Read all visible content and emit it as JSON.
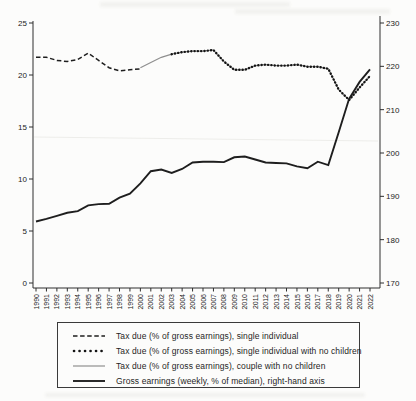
{
  "chart_data": {
    "type": "line",
    "title": "",
    "xlabel": "",
    "ylabel_left": "",
    "ylabel_right": "",
    "grid": false,
    "legend_position": "bottom",
    "x_ticks": [
      "1990",
      "1991",
      "1992",
      "1993",
      "1994",
      "1995",
      "1996",
      "1997",
      "1998",
      "1999",
      "2000",
      "2001",
      "2002",
      "2003",
      "2004",
      "2005",
      "2006",
      "2007",
      "2008",
      "2009",
      "2010",
      "2011",
      "2012",
      "2013",
      "2014",
      "2015",
      "2016",
      "2017",
      "2018",
      "2019",
      "2020",
      "2021",
      "2022"
    ],
    "left_axis": {
      "ticks": [
        0,
        5,
        10,
        15,
        20,
        25
      ],
      "range": [
        0,
        25
      ]
    },
    "right_axis": {
      "ticks": [
        170,
        180,
        190,
        200,
        210,
        220,
        230
      ],
      "range": [
        170,
        230
      ]
    },
    "series": [
      {
        "name": "Tax due (% of gross earnings), single individual",
        "axis": "left",
        "style": "dashed",
        "years": [
          1990,
          1991,
          1992,
          1993,
          1994,
          1995,
          1996,
          1997,
          1998,
          1999,
          2000
        ],
        "values": [
          21.7,
          21.7,
          21.4,
          21.3,
          21.5,
          22.1,
          21.4,
          20.7,
          20.4,
          20.5,
          20.6
        ]
      },
      {
        "name": "Tax due (% of gross earnings), couple with no children",
        "axis": "left",
        "style": "solid-thin",
        "years": [
          2000,
          2001,
          2002,
          2003,
          2004,
          2005,
          2006,
          2007,
          2008,
          2009,
          2010,
          2011,
          2012,
          2013,
          2014,
          2015,
          2016,
          2017,
          2018,
          2019,
          2020,
          2021,
          2022
        ],
        "values": [
          20.7,
          21.2,
          21.7,
          22.0,
          22.2,
          22.3,
          22.3,
          22.4,
          21.3,
          20.5,
          20.5,
          20.9,
          21.0,
          20.9,
          20.9,
          21.0,
          20.8,
          20.8,
          20.6,
          18.6,
          17.6,
          18.8,
          19.9
        ]
      },
      {
        "name": "Tax due (% of gross earnings), single individual with no children",
        "axis": "left",
        "style": "dotted",
        "years": [
          2003,
          2004,
          2005,
          2006,
          2007,
          2008,
          2009,
          2010,
          2011,
          2012,
          2013,
          2014,
          2015,
          2016,
          2017,
          2018,
          2019,
          2020,
          2021,
          2022
        ],
        "values": [
          22.0,
          22.2,
          22.3,
          22.3,
          22.4,
          21.3,
          20.5,
          20.5,
          20.9,
          21.0,
          20.9,
          20.9,
          21.0,
          20.8,
          20.8,
          20.6,
          18.6,
          17.6,
          18.8,
          19.9
        ]
      },
      {
        "name": "Gross earnings (weekly, % of median), right-hand axis",
        "axis": "right",
        "style": "solid-thick",
        "years": [
          1990,
          1991,
          1992,
          1993,
          1994,
          1995,
          1996,
          1997,
          1998,
          1999,
          2000,
          2001,
          2002,
          2003,
          2004,
          2005,
          2006,
          2007,
          2008,
          2009,
          2010,
          2011,
          2012,
          2013,
          2014,
          2015,
          2016,
          2017,
          2018,
          2019,
          2020,
          2021,
          2022
        ],
        "values": [
          184.2,
          184.8,
          185.5,
          186.2,
          186.6,
          187.9,
          188.2,
          188.3,
          189.7,
          190.6,
          193.0,
          195.8,
          196.2,
          195.4,
          196.3,
          197.8,
          198.0,
          198.0,
          197.9,
          199.0,
          199.2,
          198.5,
          197.8,
          197.7,
          197.6,
          196.9,
          196.5,
          198.0,
          197.2,
          204.8,
          212.5,
          216.4,
          219.3
        ]
      }
    ]
  },
  "legend": {
    "items": [
      {
        "label": "Tax due (% of gross earnings), single individual",
        "style": "dashed"
      },
      {
        "label": "Tax due (% of gross earnings), single individual with no children",
        "style": "dotted"
      },
      {
        "label": "Tax due (% of gross earnings), couple with no children",
        "style": "solid-thin"
      },
      {
        "label": "Gross earnings (weekly, % of median), right-hand axis",
        "style": "solid-thick"
      }
    ]
  },
  "colors": {
    "line_dark": "#1e1e1e",
    "line_gray": "#8f8f8f",
    "axis": "#2e2e2e",
    "background": "#fcfcfb"
  }
}
